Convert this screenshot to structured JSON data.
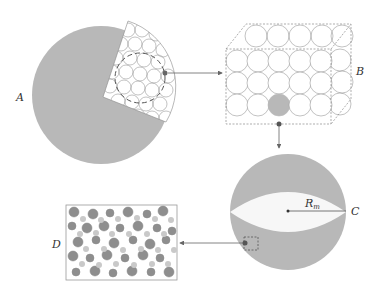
{
  "labels": {
    "a": "A",
    "b": "B",
    "c": "C",
    "d": "D",
    "rm": "R",
    "rm_sub": "m"
  },
  "colors": {
    "gray_fill": "#b8b8b8",
    "line": "#777777",
    "dark_gray": "#8e8e8e",
    "light_gray": "#c9c9c9"
  }
}
